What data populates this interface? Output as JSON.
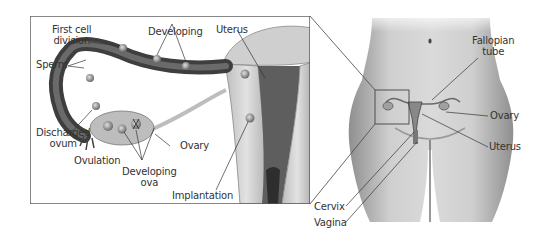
{
  "diagram": {
    "type": "anatomical-illustration",
    "inset": {
      "labels": {
        "first_cell_division": [
          "First cell",
          "division"
        ],
        "developing": "Developing",
        "uterus": "Uterus",
        "sperm": "Sperm",
        "discharged_ovum": [
          "Discharged",
          "ovum"
        ],
        "ovulation": "Ovulation",
        "ovary": "Ovary",
        "developing_ova": [
          "Developing",
          "ova"
        ],
        "implantation": "Implantation"
      }
    },
    "body": {
      "labels": {
        "fallopian_tube": [
          "Fallopian",
          "tube"
        ],
        "ovary": "Ovary",
        "uterus": "Uterus",
        "cervix": "Cervix",
        "vagina": "Vagina"
      }
    },
    "colors": {
      "line": "#333333",
      "tissue_dark": "#4a4a4a",
      "tissue_mid": "#8a8a8a",
      "tissue_light": "#c8c8c8",
      "skin": "#bdbdbd",
      "frame": "#555555"
    }
  }
}
